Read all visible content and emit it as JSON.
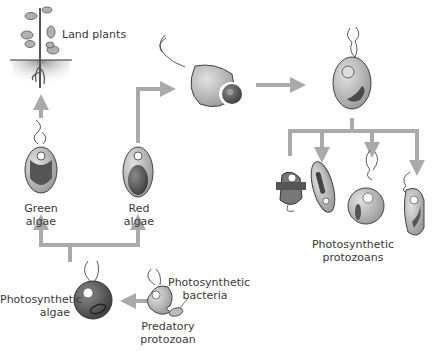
{
  "labels": {
    "land_plants": "Land plants",
    "green_algae_1": "Green",
    "green_algae_2": "algae",
    "red_algae_1": "Red",
    "red_algae_2": "algae",
    "photosynthetic_algae_1": "Photosynthetic",
    "photosynthetic_algae_2": "algae",
    "photosynthetic_bacteria_1": "Photosynthetic",
    "photosynthetic_bacteria_2": "bacteria",
    "predatory_protozoan_1": "Predatory",
    "predatory_protozoan_2": "protozoan",
    "photosynthetic_protozoans_1": "Photosynthetic",
    "photosynthetic_protozoans_2": "protozoans"
  },
  "colors": {
    "arrow": "#aaaaaa",
    "cell_fill": "#bdbdbd",
    "cell_dark": "#6a6a6a",
    "chloroplast": "#4a4a4a",
    "soil": "#9a9a9a",
    "text": "#3a3a3a"
  }
}
